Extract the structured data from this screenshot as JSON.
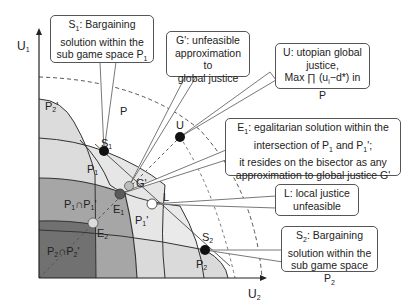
{
  "axes": {
    "y_label": "U1",
    "x_label": "U2"
  },
  "regions": {
    "P": "P",
    "P1": "P1",
    "P1_prime": "P1'",
    "P2": "P2",
    "P2_prime": "P2'",
    "P1_cap_P1prime": "P1∩P1'",
    "P2_cap_P2prime": "P2∩P2'"
  },
  "points": {
    "S1": "S1",
    "S2": "S2",
    "G_prime": "G'",
    "E1": "E1",
    "E2": "E2",
    "U": "U",
    "L": "L"
  },
  "callouts": {
    "s1": {
      "line1": "S1: Bargaining",
      "line2": "solution within the",
      "line3": "sub game space P1"
    },
    "g_prime": {
      "line1": "G': unfeasible",
      "line2": "approximation to",
      "line3": "global justice"
    },
    "u": {
      "line1": "U: utopian global",
      "line2": "justice,",
      "line3": "Max ∏ (ui−d*) in P"
    },
    "e1": {
      "line1": "E1: egalitarian solution within the",
      "line2": "intersection of P1 and P1';",
      "line3": "it resides on the bisector as any",
      "line4": "approximation to global justice G'"
    },
    "l": {
      "line1": "L: local justice",
      "line2": "unfeasible"
    },
    "s2": {
      "line1": "S2: Bargaining",
      "line2": "solution within the",
      "line3": "sub game space P2"
    }
  },
  "colors": {
    "region_light": "#e9e9e9",
    "region_mid": "#c4c4c4",
    "region_med": "#9d9d9d",
    "region_dark": "#6e6e6e",
    "point_black": "#111111",
    "point_gray": "#b8b8b8",
    "point_dark_gray": "#555555",
    "point_white": "#ffffff"
  }
}
